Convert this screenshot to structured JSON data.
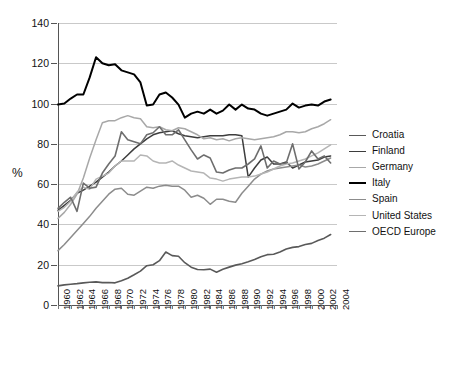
{
  "chart_data": {
    "type": "line",
    "title": "",
    "subtitle": "",
    "xlabel": "",
    "ylabel": "%",
    "ylim": [
      0,
      140
    ],
    "ytick_values": [
      0,
      20,
      40,
      60,
      80,
      100,
      120,
      140
    ],
    "ytick_labels": [
      "0",
      "20",
      "40",
      "60",
      "80",
      "100",
      "120",
      "140"
    ],
    "xlim": [
      1960,
      2004
    ],
    "xtick_labels": [
      "1960",
      "1962",
      "1964",
      "1966",
      "1968",
      "1970",
      "1972",
      "1974",
      "1976",
      "1978",
      "1980",
      "1982",
      "1984",
      "1986",
      "1988",
      "1990",
      "1992",
      "1994",
      "1996",
      "1998",
      "2000",
      "2002",
      "2004"
    ],
    "grid": "horizontal",
    "legend_position": "right",
    "x": [
      1960,
      1961,
      1962,
      1963,
      1964,
      1965,
      1966,
      1967,
      1968,
      1969,
      1970,
      1971,
      1972,
      1973,
      1974,
      1975,
      1976,
      1977,
      1978,
      1979,
      1980,
      1981,
      1982,
      1983,
      1984,
      1985,
      1986,
      1987,
      1988,
      1989,
      1990,
      1991,
      1992,
      1993,
      1994,
      1995,
      1996,
      1997,
      1998,
      1999,
      2000,
      2001,
      2002,
      2003
    ],
    "series": [
      {
        "name": "Croatia",
        "color": "#595959",
        "width": 1.6,
        "values": [
          9.5,
          10.0,
          10.3,
          10.6,
          11.0,
          11.3,
          11.5,
          11.1,
          11.2,
          11.0,
          12.0,
          13.3,
          15.0,
          16.8,
          19.5,
          20.0,
          22.0,
          26.3,
          24.5,
          24.2,
          21.0,
          18.8,
          17.6,
          17.5,
          17.8,
          16.3,
          17.7,
          18.8,
          19.8,
          20.5,
          21.5,
          22.6,
          24.0,
          25.0,
          25.2,
          26.3,
          27.8,
          28.6,
          29.0,
          30.0,
          30.6,
          32.0,
          33.2,
          35.0
        ]
      },
      {
        "name": "Finland",
        "color": "#3d3d3d",
        "width": 1.5,
        "values": [
          47.0,
          49.5,
          52.0,
          55.5,
          57.0,
          59.0,
          61.0,
          63.5,
          66.0,
          69.0,
          71.5,
          74.5,
          77.5,
          80.0,
          82.5,
          84.5,
          85.5,
          86.0,
          86.5,
          85.0,
          84.0,
          83.5,
          83.0,
          83.5,
          84.0,
          84.0,
          84.0,
          84.5,
          84.5,
          84.0,
          63.5,
          68.0,
          72.0,
          73.5,
          70.0,
          70.0,
          71.0,
          68.0,
          69.5,
          71.0,
          71.5,
          72.0,
          73.5,
          74.0
        ]
      },
      {
        "name": "Germany",
        "color": "#a8a8a8",
        "width": 1.5,
        "values": [
          43.0,
          46.0,
          50.0,
          55.0,
          63.0,
          73.0,
          82.0,
          90.5,
          91.5,
          91.5,
          93.0,
          94.0,
          93.0,
          92.5,
          88.5,
          88.0,
          88.5,
          87.0,
          86.5,
          88.0,
          87.5,
          86.0,
          84.5,
          82.5,
          83.0,
          82.0,
          82.5,
          81.5,
          82.5,
          83.0,
          82.5,
          82.0,
          82.5,
          83.0,
          83.5,
          84.5,
          86.0,
          86.0,
          85.5,
          86.0,
          87.5,
          88.5,
          90.0,
          92.0
        ]
      },
      {
        "name": "Italy",
        "color": "#000000",
        "width": 2.0,
        "values": [
          99.5,
          100.0,
          102.5,
          104.5,
          104.5,
          113.0,
          123.0,
          120.0,
          119.0,
          119.5,
          116.5,
          115.5,
          114.5,
          110.5,
          99.0,
          99.5,
          104.5,
          105.5,
          103.0,
          99.5,
          93.0,
          95.0,
          96.0,
          95.0,
          97.0,
          95.0,
          96.5,
          99.5,
          97.0,
          99.5,
          97.5,
          97.0,
          95.0,
          94.0,
          95.0,
          96.0,
          97.0,
          100.0,
          98.0,
          99.0,
          99.5,
          99.0,
          101.0,
          102.0
        ]
      },
      {
        "name": "Spain",
        "color": "#8c8c8c",
        "width": 1.5,
        "values": [
          27.0,
          30.0,
          33.5,
          37.0,
          40.5,
          44.0,
          48.0,
          51.5,
          55.0,
          57.5,
          58.0,
          55.0,
          54.5,
          56.5,
          58.5,
          58.0,
          59.0,
          59.5,
          59.0,
          59.0,
          57.0,
          53.5,
          54.5,
          53.0,
          50.0,
          52.5,
          52.5,
          51.5,
          51.0,
          55.5,
          59.0,
          62.5,
          65.0,
          66.5,
          67.5,
          68.0,
          68.5,
          69.0,
          69.5,
          68.5,
          69.0,
          70.0,
          71.5,
          73.0
        ]
      },
      {
        "name": "United States",
        "color": "#b5b5b5",
        "width": 1.5,
        "values": [
          46.5,
          48.5,
          51.5,
          56.0,
          58.5,
          57.5,
          62.5,
          64.0,
          65.5,
          69.0,
          71.5,
          71.5,
          71.5,
          74.5,
          74.0,
          71.5,
          70.5,
          70.5,
          71.5,
          69.5,
          68.0,
          66.5,
          66.0,
          65.5,
          63.0,
          62.5,
          61.5,
          62.5,
          63.0,
          63.5,
          63.5,
          64.0,
          65.0,
          66.0,
          67.5,
          69.0,
          70.0,
          70.5,
          71.5,
          72.5,
          74.0,
          75.5,
          77.5,
          79.5
        ]
      },
      {
        "name": "OECD Europe",
        "color": "#6e6e6e",
        "width": 1.6,
        "values": [
          48.0,
          51.0,
          53.5,
          46.5,
          60.5,
          58.0,
          58.5,
          65.5,
          70.0,
          74.0,
          86.0,
          82.0,
          81.0,
          80.0,
          84.5,
          85.5,
          88.5,
          84.5,
          84.5,
          87.0,
          82.0,
          77.0,
          72.5,
          74.5,
          73.0,
          66.0,
          65.5,
          67.0,
          68.0,
          68.0,
          70.0,
          72.5,
          79.0,
          68.0,
          71.5,
          70.0,
          70.5,
          80.0,
          67.5,
          71.0,
          76.5,
          72.5,
          74.0,
          70.5
        ]
      }
    ]
  },
  "legend": {
    "items": [
      {
        "label": "Croatia"
      },
      {
        "label": "Finland"
      },
      {
        "label": "Germany"
      },
      {
        "label": "Italy"
      },
      {
        "label": "Spain"
      },
      {
        "label": "United States"
      },
      {
        "label": "OECD Europe"
      }
    ]
  }
}
